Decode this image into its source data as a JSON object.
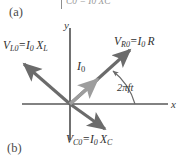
{
  "figure": {
    "panel_a_label": "(a)",
    "panel_b_label": "(b)",
    "top_fragment": "C0 = I0 XC",
    "axes": {
      "y_label": "y",
      "x_label": "x"
    },
    "angle": {
      "label": "2πft"
    },
    "vectors": [
      {
        "name": "resistor-voltage-phasor",
        "label": "Vᴿ₀ = I₀ R",
        "symbol": "V",
        "subscript": "R0",
        "equals": "=",
        "expression_current": "I",
        "expression_sub": "0",
        "expression_term": "R",
        "direction_deg": 42,
        "color": "#6f6f6f"
      },
      {
        "name": "inductor-voltage-phasor",
        "label": "Vᴸ₀ = I₀ Xᴸ",
        "symbol": "V",
        "subscript": "L0",
        "equals": "=",
        "expression_current": "I",
        "expression_sub": "0",
        "expression_term": "X",
        "expression_term_sub": "L",
        "direction_deg": 138,
        "color": "#6f6f6f"
      },
      {
        "name": "capacitor-voltage-phasor",
        "label": "Vᶜ₀ = I₀ Xᶜ",
        "symbol": "V",
        "subscript": "C0",
        "equals": "=",
        "expression_current": "I",
        "expression_sub": "0",
        "expression_term": "X",
        "expression_term_sub": "C",
        "direction_deg": -42,
        "color": "#6f6f6f"
      },
      {
        "name": "current-phasor",
        "label": "I₀",
        "symbol": "I",
        "subscript": "0",
        "direction_deg": 42,
        "color": "#9a9a9a"
      }
    ],
    "colors": {
      "axis": "#585858",
      "vector_dark": "#6b6b6b",
      "vector_light": "#9d9d9d",
      "arc": "#6a6a6a",
      "text": "#2f2f2f"
    }
  }
}
